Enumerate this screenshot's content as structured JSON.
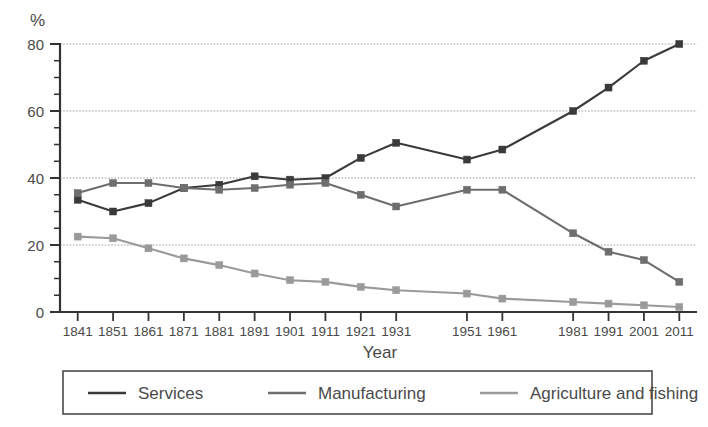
{
  "chart_data": {
    "type": "line",
    "title": "",
    "xlabel": "Year",
    "ylabel": "%",
    "ylim": [
      0,
      80
    ],
    "ytick_values": [
      0,
      20,
      40,
      60,
      80
    ],
    "ytick_labels": [
      "0",
      "20",
      "40",
      "60",
      "80"
    ],
    "yminor_step": 5,
    "grid": true,
    "grid_axis": "y",
    "legend_position": "bottom",
    "marker": "square",
    "categories": [
      "1841",
      "1851",
      "1861",
      "1871",
      "1881",
      "1891",
      "1901",
      "1911",
      "1921",
      "1931",
      "1951",
      "1961",
      "1981",
      "1991",
      "2001",
      "2011"
    ],
    "x": [
      1841,
      1851,
      1861,
      1871,
      1881,
      1891,
      1901,
      1911,
      1921,
      1931,
      1951,
      1961,
      1981,
      1991,
      2001,
      2011
    ],
    "xlim": [
      1836,
      2016
    ],
    "series": [
      {
        "name": "Services",
        "color": "#3a3a3a",
        "values": [
          33.5,
          30.0,
          32.5,
          37.0,
          38.0,
          40.5,
          39.5,
          40.0,
          46.0,
          50.5,
          45.5,
          48.5,
          60.0,
          67.0,
          75.0,
          80.0
        ]
      },
      {
        "name": "Manufacturing",
        "color": "#6e6e6e",
        "values": [
          35.5,
          38.5,
          38.5,
          37.0,
          36.5,
          37.0,
          38.0,
          38.5,
          35.0,
          31.5,
          36.5,
          36.5,
          23.5,
          18.0,
          15.5,
          9.0
        ]
      },
      {
        "name": "Agriculture and fishing",
        "color": "#9a9a9a",
        "values": [
          22.5,
          22.0,
          19.0,
          16.0,
          14.0,
          11.5,
          9.5,
          9.0,
          7.5,
          6.5,
          5.5,
          4.0,
          3.0,
          2.5,
          2.0,
          1.5
        ]
      }
    ]
  },
  "axes": {
    "y_unit_label": "%",
    "x_axis_title": "Year"
  },
  "legend": {
    "entries": [
      {
        "label": "Services",
        "color": "#3a3a3a"
      },
      {
        "label": "Manufacturing",
        "color": "#6e6e6e"
      },
      {
        "label": "Agriculture and fishing",
        "color": "#9a9a9a"
      }
    ]
  },
  "colors": {
    "axis": "#333333",
    "grid": "#9d9d9d",
    "text": "#4a4a4a",
    "legend_border": "#4a4a4a",
    "background": "#ffffff"
  }
}
